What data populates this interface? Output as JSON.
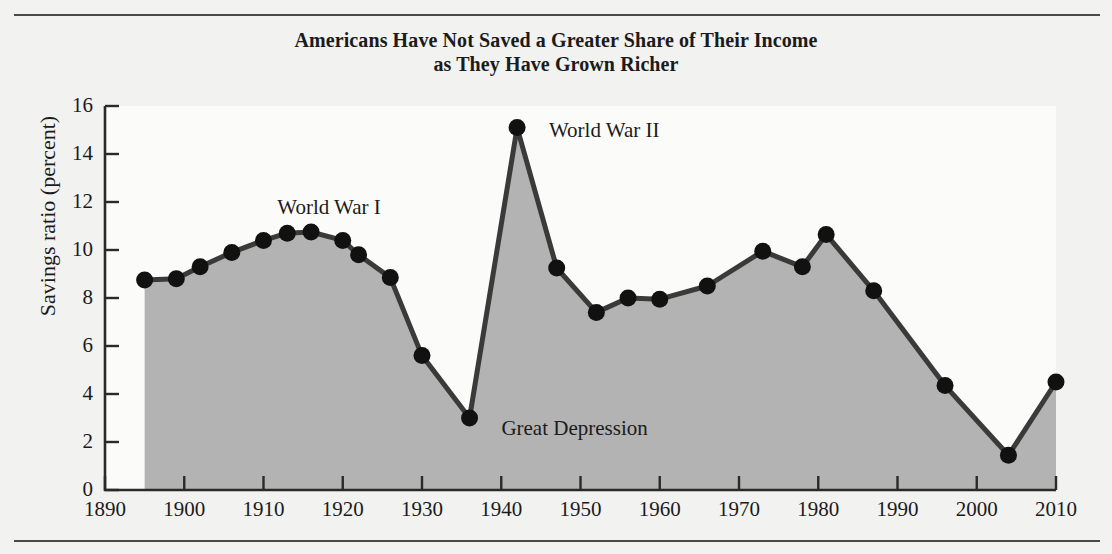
{
  "chart_data": {
    "type": "area",
    "title": "Americans Have Not Saved a Greater Share of Their Income as They Have Grown Richer",
    "title_line1": "Americans Have Not Saved a Greater Share of Their Income",
    "title_line2": "as They Have Grown Richer",
    "xlabel": "",
    "ylabel": "Savings ratio (percent)",
    "xlim": [
      1890,
      2010
    ],
    "ylim": [
      0,
      16
    ],
    "grid": false,
    "legend": null,
    "xticks": [
      1890,
      1900,
      1910,
      1920,
      1930,
      1940,
      1950,
      1960,
      1970,
      1980,
      1990,
      2000,
      2010
    ],
    "yticks": [
      0,
      2,
      4,
      6,
      8,
      10,
      12,
      14,
      16
    ],
    "xtick_labels": [
      "1890",
      "1900",
      "1910",
      "1920",
      "1930",
      "1940",
      "1950",
      "1960",
      "1970",
      "1980",
      "1990",
      "2000",
      "2010"
    ],
    "ytick_labels": [
      "0",
      "2",
      "4",
      "6",
      "8",
      "10",
      "12",
      "14",
      "16"
    ],
    "x": [
      1895,
      1899,
      1902,
      1906,
      1910,
      1913,
      1916,
      1920,
      1922,
      1926,
      1930,
      1936,
      1942,
      1947,
      1952,
      1956,
      1960,
      1966,
      1973,
      1978,
      1981,
      1987,
      1996,
      2004,
      2010
    ],
    "values": [
      8.75,
      8.8,
      9.3,
      9.9,
      10.4,
      10.7,
      10.75,
      10.4,
      9.8,
      8.85,
      5.6,
      3.0,
      15.1,
      9.25,
      7.4,
      8.0,
      7.95,
      8.5,
      9.95,
      9.3,
      10.65,
      8.3,
      4.35,
      1.45,
      4.5
    ],
    "series": [
      {
        "name": "Savings ratio",
        "x": [
          1895,
          1899,
          1902,
          1906,
          1910,
          1913,
          1916,
          1920,
          1922,
          1926,
          1930,
          1936,
          1942,
          1947,
          1952,
          1956,
          1960,
          1966,
          1973,
          1978,
          1981,
          1987,
          1996,
          2004,
          2010
        ],
        "values": [
          8.75,
          8.8,
          9.3,
          9.9,
          10.4,
          10.7,
          10.75,
          10.4,
          9.8,
          8.85,
          5.6,
          3.0,
          15.1,
          9.25,
          7.4,
          8.0,
          7.95,
          8.5,
          9.95,
          9.3,
          10.65,
          8.3,
          4.35,
          1.45,
          4.5
        ]
      }
    ],
    "annotations": [
      {
        "text": "World War I",
        "x": 1913,
        "y": 11.7
      },
      {
        "text": "World War II",
        "x": 1944,
        "y": 14.9
      },
      {
        "text": "Great Depression",
        "x": 1938,
        "y": 2.5
      }
    ],
    "colors": {
      "line": "#3a3a3a",
      "marker": "#111111",
      "fill": "#b3b3b3",
      "axis": "#2a2a2a",
      "background": "#f2f2f0",
      "plot_background": "#fbfbfa",
      "text": "#1b1b1b"
    }
  }
}
